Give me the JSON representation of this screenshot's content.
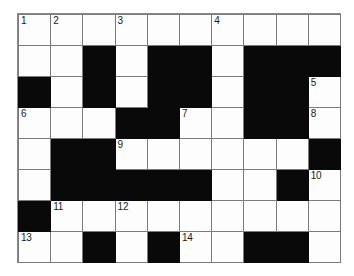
{
  "puzzle": {
    "type": "crossword-grid",
    "rows": 8,
    "columns": 10,
    "colors": {
      "block": "#090909",
      "open": "#fdfdfd",
      "grid_line": "#7b7b7b",
      "number_text": "#1a1a1a",
      "page_background": "#ffffff"
    },
    "legend": {
      "open_cell": "white fillable square",
      "block_cell": "black blocked square"
    },
    "clue_numbers": [
      1,
      2,
      3,
      4,
      5,
      6,
      7,
      8,
      9,
      10,
      11,
      12,
      13,
      14
    ],
    "grid": [
      [
        {
          "block": false,
          "number": "1"
        },
        {
          "block": false,
          "number": "2"
        },
        {
          "block": false,
          "number": ""
        },
        {
          "block": false,
          "number": "3"
        },
        {
          "block": false,
          "number": ""
        },
        {
          "block": false,
          "number": ""
        },
        {
          "block": false,
          "number": "4"
        },
        {
          "block": false,
          "number": ""
        },
        {
          "block": false,
          "number": ""
        },
        {
          "block": false,
          "number": ""
        }
      ],
      [
        {
          "block": false,
          "number": ""
        },
        {
          "block": false,
          "number": ""
        },
        {
          "block": true,
          "number": ""
        },
        {
          "block": false,
          "number": ""
        },
        {
          "block": true,
          "number": ""
        },
        {
          "block": true,
          "number": ""
        },
        {
          "block": false,
          "number": ""
        },
        {
          "block": true,
          "number": ""
        },
        {
          "block": true,
          "number": ""
        },
        {
          "block": true,
          "number": ""
        }
      ],
      [
        {
          "block": true,
          "number": ""
        },
        {
          "block": false,
          "number": ""
        },
        {
          "block": true,
          "number": ""
        },
        {
          "block": false,
          "number": ""
        },
        {
          "block": true,
          "number": ""
        },
        {
          "block": true,
          "number": ""
        },
        {
          "block": false,
          "number": ""
        },
        {
          "block": true,
          "number": ""
        },
        {
          "block": true,
          "number": ""
        },
        {
          "block": false,
          "number": "5"
        }
      ],
      [
        {
          "block": false,
          "number": "6"
        },
        {
          "block": false,
          "number": ""
        },
        {
          "block": false,
          "number": ""
        },
        {
          "block": true,
          "number": ""
        },
        {
          "block": true,
          "number": ""
        },
        {
          "block": false,
          "number": "7"
        },
        {
          "block": false,
          "number": ""
        },
        {
          "block": true,
          "number": ""
        },
        {
          "block": true,
          "number": ""
        },
        {
          "block": false,
          "number": "8"
        }
      ],
      [
        {
          "block": false,
          "number": ""
        },
        {
          "block": true,
          "number": ""
        },
        {
          "block": true,
          "number": ""
        },
        {
          "block": false,
          "number": "9"
        },
        {
          "block": false,
          "number": ""
        },
        {
          "block": false,
          "number": ""
        },
        {
          "block": false,
          "number": ""
        },
        {
          "block": false,
          "number": ""
        },
        {
          "block": false,
          "number": ""
        },
        {
          "block": true,
          "number": ""
        }
      ],
      [
        {
          "block": false,
          "number": ""
        },
        {
          "block": true,
          "number": ""
        },
        {
          "block": true,
          "number": ""
        },
        {
          "block": true,
          "number": ""
        },
        {
          "block": true,
          "number": ""
        },
        {
          "block": true,
          "number": ""
        },
        {
          "block": false,
          "number": ""
        },
        {
          "block": false,
          "number": ""
        },
        {
          "block": true,
          "number": ""
        },
        {
          "block": false,
          "number": "10"
        }
      ],
      [
        {
          "block": true,
          "number": ""
        },
        {
          "block": false,
          "number": "11"
        },
        {
          "block": false,
          "number": ""
        },
        {
          "block": false,
          "number": "12"
        },
        {
          "block": false,
          "number": ""
        },
        {
          "block": false,
          "number": ""
        },
        {
          "block": false,
          "number": ""
        },
        {
          "block": false,
          "number": ""
        },
        {
          "block": false,
          "number": ""
        },
        {
          "block": false,
          "number": ""
        }
      ],
      [
        {
          "block": false,
          "number": "13"
        },
        {
          "block": false,
          "number": ""
        },
        {
          "block": true,
          "number": ""
        },
        {
          "block": false,
          "number": ""
        },
        {
          "block": true,
          "number": ""
        },
        {
          "block": false,
          "number": "14"
        },
        {
          "block": false,
          "number": ""
        },
        {
          "block": true,
          "number": ""
        },
        {
          "block": true,
          "number": ""
        },
        {
          "block": false,
          "number": ""
        }
      ]
    ]
  }
}
